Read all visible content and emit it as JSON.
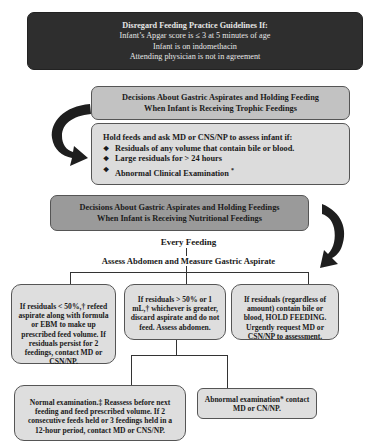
{
  "disregard_box": {
    "title": "Disregard Feeding Practice Guidelines  If:",
    "lines": [
      "Infant’s Apgar score is ≤ 3 at 5 minutes of age",
      "Infant is on indomethacin",
      "Attending physician is not in agreement"
    ]
  },
  "trophic_section": {
    "header_line1": "Decisions About Gastric Aspirates and Holding Feeding",
    "header_line2": "When Infant is Receiving Trophic Feedings",
    "hold_intro": "Hold feeds and ask MD or CNS/NP to assess infant if:",
    "hold_items": [
      "Residuals of any volume that contain bile or blood.",
      "Large residuals for > 24 hours",
      "Abnormal Clinical Examination"
    ],
    "hold_item3_mark": "*",
    "bullet_glyph": "❖"
  },
  "nutritional_section": {
    "header_line1": "Decisions About Gastric Aspirates and Holding Feedings",
    "header_line2": "When Infant is Receiving Nutritional Feedings",
    "every_feeding": "Every Feeding",
    "assess": "Assess Abdomen and Measure Gastric Aspirate",
    "branches": [
      {
        "text": "If residuals < 50%,† refeed aspirate along with formula or EBM to make up prescribed feed volume.  If residuals persist for 2 feedings, contact MD or CSN/NP."
      },
      {
        "text": "If residuals > 50% or 1 mL,† whichever is greater, discard aspirate and do not feed.  Assess abdomen."
      },
      {
        "text": "If residuals (regardless of amount) contain bile or blood, HOLD FEEDING. Urgently request MD or CSN/NP to assessment."
      }
    ],
    "outcomes": [
      {
        "text": "Normal examination.‡ Reassess before next feeding and feed prescribed volume.  If 2 consecutive feeds held or 3 feedings held in a 12-hour period, contact MD or CNS/NP."
      },
      {
        "text": "Abnormal examination* contact MD or CN/NP."
      }
    ]
  },
  "colors": {
    "dark_box": "#2e2e2e",
    "grey_header": "#c2c2c2",
    "dark_header": "#9a9a9a",
    "light_box": "#dedede",
    "arrow": "#1e1e1e"
  }
}
